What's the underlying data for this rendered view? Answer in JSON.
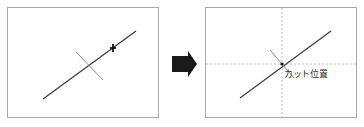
{
  "diagram": {
    "before": {
      "description": "Line with perpendicular cross marker and cursor near upper end"
    },
    "arrow": {
      "icon": "right-arrow-icon",
      "color": "#1a1a1a"
    },
    "after": {
      "cut_label": "カット位置"
    }
  },
  "colors": {
    "border": "#a8a8a8",
    "line": "#3a3a3a",
    "cross": "#8a8a8a",
    "guides": "#bdbdbd"
  }
}
